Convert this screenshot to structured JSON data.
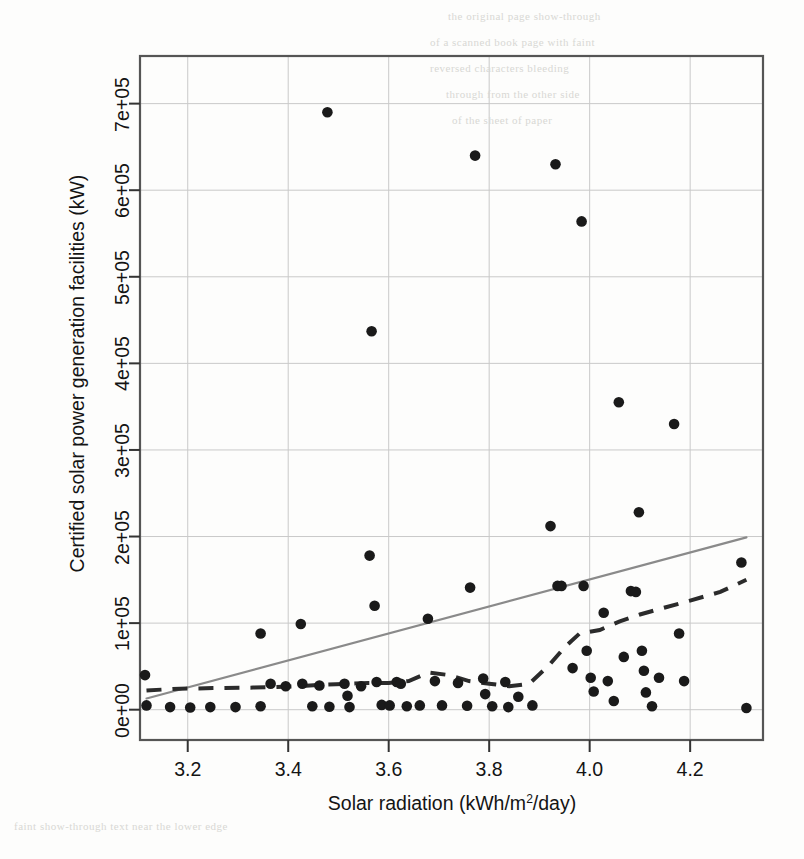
{
  "figure": {
    "kind": "scatter-with-trendlines",
    "background": "#fdfdfc",
    "ink_color": "#1a1a1a",
    "grid_color": "#c9c9c9",
    "frame_color": "#555555",
    "regression_color": "#8a8a8a",
    "loess_color": "#2b2b2b"
  },
  "axes": {
    "x_title_parts": {
      "before": "Solar radiation (kWh/m",
      "sup": "2",
      "after": "/day)"
    },
    "x_title_plain": "Solar radiation (kWh/m2/day)",
    "y_title": "Certified solar power generation facilities (kW)"
  },
  "chart_data": {
    "type": "scatter",
    "title": "",
    "xlabel": "Solar radiation (kWh/m2/day)",
    "ylabel": "Certified solar power generation facilities (kW)",
    "xlim": [
      3.105,
      4.345
    ],
    "ylim": [
      -35000,
      755000
    ],
    "grid": true,
    "legend": "none",
    "xticks": [
      3.2,
      3.4,
      3.6,
      3.8,
      4.0,
      4.2
    ],
    "xtick_labels": [
      "3.2",
      "3.4",
      "3.6",
      "3.8",
      "4.0",
      "4.2"
    ],
    "yticks": [
      0,
      100000,
      200000,
      300000,
      400000,
      500000,
      600000,
      700000
    ],
    "ytick_labels": [
      "0e+00",
      "1e+05",
      "2e+05",
      "3e+05",
      "4e+05",
      "5e+05",
      "6e+05",
      "7e+05"
    ],
    "points": [
      {
        "x": 3.115,
        "y": 40000
      },
      {
        "x": 3.118,
        "y": 5000
      },
      {
        "x": 3.165,
        "y": 3000
      },
      {
        "x": 3.205,
        "y": 2500
      },
      {
        "x": 3.245,
        "y": 3000
      },
      {
        "x": 3.295,
        "y": 3000
      },
      {
        "x": 3.345,
        "y": 88000
      },
      {
        "x": 3.345,
        "y": 4000
      },
      {
        "x": 3.365,
        "y": 30000
      },
      {
        "x": 3.395,
        "y": 27000
      },
      {
        "x": 3.425,
        "y": 99000
      },
      {
        "x": 3.428,
        "y": 30000
      },
      {
        "x": 3.448,
        "y": 4000
      },
      {
        "x": 3.462,
        "y": 28000
      },
      {
        "x": 3.478,
        "y": 690000
      },
      {
        "x": 3.482,
        "y": 3500
      },
      {
        "x": 3.512,
        "y": 30000
      },
      {
        "x": 3.518,
        "y": 16000
      },
      {
        "x": 3.522,
        "y": 3000
      },
      {
        "x": 3.545,
        "y": 27000
      },
      {
        "x": 3.562,
        "y": 178000
      },
      {
        "x": 3.566,
        "y": 437000
      },
      {
        "x": 3.572,
        "y": 120000
      },
      {
        "x": 3.576,
        "y": 32000
      },
      {
        "x": 3.586,
        "y": 5500
      },
      {
        "x": 3.602,
        "y": 5000
      },
      {
        "x": 3.616,
        "y": 32000
      },
      {
        "x": 3.624,
        "y": 30000
      },
      {
        "x": 3.636,
        "y": 4000
      },
      {
        "x": 3.662,
        "y": 5000
      },
      {
        "x": 3.678,
        "y": 105000
      },
      {
        "x": 3.692,
        "y": 33000
      },
      {
        "x": 3.706,
        "y": 5000
      },
      {
        "x": 3.738,
        "y": 31000
      },
      {
        "x": 3.756,
        "y": 4500
      },
      {
        "x": 3.762,
        "y": 141000
      },
      {
        "x": 3.772,
        "y": 640000
      },
      {
        "x": 3.788,
        "y": 36000
      },
      {
        "x": 3.792,
        "y": 18000
      },
      {
        "x": 3.806,
        "y": 4000
      },
      {
        "x": 3.832,
        "y": 32000
      },
      {
        "x": 3.838,
        "y": 3000
      },
      {
        "x": 3.858,
        "y": 15000
      },
      {
        "x": 3.886,
        "y": 5000
      },
      {
        "x": 3.922,
        "y": 212000
      },
      {
        "x": 3.932,
        "y": 630000
      },
      {
        "x": 3.936,
        "y": 143000
      },
      {
        "x": 3.944,
        "y": 143000
      },
      {
        "x": 3.966,
        "y": 48000
      },
      {
        "x": 3.984,
        "y": 564000
      },
      {
        "x": 3.988,
        "y": 143000
      },
      {
        "x": 3.994,
        "y": 68000
      },
      {
        "x": 4.002,
        "y": 37000
      },
      {
        "x": 4.008,
        "y": 21000
      },
      {
        "x": 4.028,
        "y": 112000
      },
      {
        "x": 4.036,
        "y": 33000
      },
      {
        "x": 4.048,
        "y": 10000
      },
      {
        "x": 4.058,
        "y": 355000
      },
      {
        "x": 4.068,
        "y": 61000
      },
      {
        "x": 4.082,
        "y": 137000
      },
      {
        "x": 4.092,
        "y": 136000
      },
      {
        "x": 4.098,
        "y": 228000
      },
      {
        "x": 4.104,
        "y": 68000
      },
      {
        "x": 4.108,
        "y": 45000
      },
      {
        "x": 4.112,
        "y": 20000
      },
      {
        "x": 4.124,
        "y": 4000
      },
      {
        "x": 4.138,
        "y": 37000
      },
      {
        "x": 4.168,
        "y": 330000
      },
      {
        "x": 4.178,
        "y": 88000
      },
      {
        "x": 4.188,
        "y": 33000
      },
      {
        "x": 4.302,
        "y": 170000
      },
      {
        "x": 4.312,
        "y": 2000
      }
    ],
    "regression_line": {
      "style": "solid",
      "color": "#8a8a8a",
      "x_start": 3.118,
      "y_start": 13000,
      "x_end": 4.312,
      "y_end": 199000
    },
    "loess_line": {
      "style": "dashed",
      "color": "#2b2b2b",
      "points": [
        {
          "x": 3.118,
          "y": 22000
        },
        {
          "x": 3.17,
          "y": 24000
        },
        {
          "x": 3.25,
          "y": 25000
        },
        {
          "x": 3.33,
          "y": 25500
        },
        {
          "x": 3.42,
          "y": 27000
        },
        {
          "x": 3.47,
          "y": 29000
        },
        {
          "x": 3.52,
          "y": 30000
        },
        {
          "x": 3.56,
          "y": 31000
        },
        {
          "x": 3.6,
          "y": 31000
        },
        {
          "x": 3.64,
          "y": 33000
        },
        {
          "x": 3.68,
          "y": 43000
        },
        {
          "x": 3.72,
          "y": 40000
        },
        {
          "x": 3.76,
          "y": 33000
        },
        {
          "x": 3.8,
          "y": 30000
        },
        {
          "x": 3.84,
          "y": 27000
        },
        {
          "x": 3.88,
          "y": 30000
        },
        {
          "x": 3.92,
          "y": 52000
        },
        {
          "x": 3.95,
          "y": 72000
        },
        {
          "x": 3.98,
          "y": 88000
        },
        {
          "x": 4.02,
          "y": 92000
        },
        {
          "x": 4.06,
          "y": 102000
        },
        {
          "x": 4.1,
          "y": 110000
        },
        {
          "x": 4.15,
          "y": 118000
        },
        {
          "x": 4.2,
          "y": 126000
        },
        {
          "x": 4.26,
          "y": 136000
        },
        {
          "x": 4.312,
          "y": 150000
        }
      ]
    }
  },
  "ghost_text": {
    "lines": [
      {
        "x": 448,
        "y": 10,
        "text": "the original page show-through"
      },
      {
        "x": 430,
        "y": 36,
        "text": "of a scanned book page with faint"
      },
      {
        "x": 430,
        "y": 62,
        "text": "reversed characters bleeding"
      },
      {
        "x": 446,
        "y": 88,
        "text": "through from the other side"
      },
      {
        "x": 452,
        "y": 114,
        "text": "of the sheet of paper"
      },
      {
        "x": 14,
        "y": 820,
        "text": "faint show-through text near the lower edge"
      }
    ]
  }
}
